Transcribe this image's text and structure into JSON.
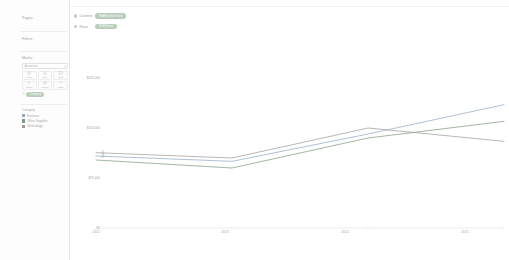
{
  "app": {
    "type": "data-visualization-worksheet"
  },
  "left_panel": {
    "pages": {
      "label": "Pages"
    },
    "filters": {
      "label": "Filters"
    },
    "marks": {
      "label": "Marks",
      "mark_type": "Automatic",
      "buttons": [
        {
          "name": "color",
          "label": "Color",
          "icon": "color-icon"
        },
        {
          "name": "size",
          "label": "Size",
          "icon": "size-icon"
        },
        {
          "name": "label",
          "label": "Label",
          "icon": "label-icon"
        },
        {
          "name": "detail",
          "label": "Detail",
          "icon": "detail-icon"
        },
        {
          "name": "tooltip",
          "label": "Tooltip",
          "icon": "tooltip-icon"
        },
        {
          "name": "path",
          "label": "Path",
          "icon": "path-icon"
        }
      ],
      "encoding_pills": [
        {
          "label": "Category",
          "shelf_icon": "color-swatch-icon",
          "color": "#b9ccb9"
        }
      ]
    },
    "legend": {
      "title": "Category",
      "items": [
        {
          "label": "Furniture",
          "color": "#8fa8c4"
        },
        {
          "label": "Office Supplies",
          "color": "#7e9a7e"
        },
        {
          "label": "Technology",
          "color": "#9b9b9b"
        }
      ]
    }
  },
  "shelves": [
    {
      "name": "columns",
      "label": "Columns",
      "pills": [
        {
          "label": "YEAR(Order Date)",
          "color": "#b9ccb9"
        }
      ]
    },
    {
      "name": "rows",
      "label": "Rows",
      "pills": [
        {
          "label": "SUM(Sales)",
          "color": "#b9ccb9"
        }
      ]
    }
  ],
  "chart_data": {
    "type": "line",
    "title": "",
    "xlabel": "Year of Order Date",
    "ylabel": "Sales",
    "x": [
      "2012",
      "2013",
      "2014",
      "2015"
    ],
    "xticklabels": [
      "2012",
      "2013",
      "2014",
      "2015"
    ],
    "yticklabels": [
      "$225,000",
      "$150,000",
      "$75,000",
      "$0"
    ],
    "yticks": [
      225000,
      150000,
      75000,
      0
    ],
    "ylim": [
      0,
      225000
    ],
    "grid": false,
    "legend_position": "left-panel",
    "series": [
      {
        "name": "Furniture",
        "color": "#8fa8c4",
        "values": [
          108000,
          100000,
          141000,
          185000
        ]
      },
      {
        "name": "Office Supplies",
        "color": "#7e9a7e",
        "values": [
          102000,
          90000,
          135000,
          160000
        ]
      },
      {
        "name": "Technology",
        "color": "#9b9b9b",
        "values": [
          113000,
          105000,
          150000,
          130000
        ]
      }
    ]
  }
}
